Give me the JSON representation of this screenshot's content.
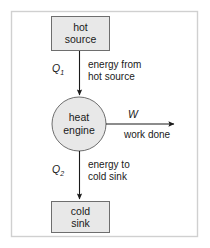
{
  "figure": {
    "frame": {
      "border_color": "#d0d0d0",
      "background": "#ffffff"
    }
  },
  "colors": {
    "box_fill": "#e8e8e8",
    "box_stroke": "#6e6e6e",
    "circle_fill": "#e8e8e8",
    "circle_stroke": "#6e6e6e",
    "arrow": "#1a1a1a",
    "text": "#1a1a1a"
  },
  "nodes": [
    {
      "id": "hot-source",
      "shape": "rect",
      "line1": "hot",
      "line2": "source"
    },
    {
      "id": "heat-engine",
      "shape": "circle",
      "line1": "heat",
      "line2": "engine"
    },
    {
      "id": "cold-sink",
      "shape": "rect",
      "line1": "cold",
      "line2": "sink"
    }
  ],
  "flows": [
    {
      "id": "q1",
      "symbol": "Q",
      "subscript": "1",
      "caption_line1": "energy from",
      "caption_line2": "hot source",
      "direction": "down",
      "from": "hot-source",
      "to": "heat-engine"
    },
    {
      "id": "w",
      "symbol": "W",
      "subscript": "",
      "caption_line1": "work done",
      "caption_line2": "",
      "direction": "right",
      "from": "heat-engine",
      "to": ""
    },
    {
      "id": "q2",
      "symbol": "Q",
      "subscript": "2",
      "caption_line1": "energy to",
      "caption_line2": "cold sink",
      "direction": "down",
      "from": "heat-engine",
      "to": "cold-sink"
    }
  ]
}
